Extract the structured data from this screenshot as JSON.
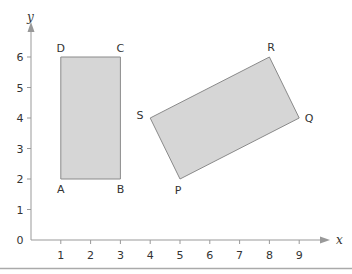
{
  "diagram": {
    "type": "coordinate-grid",
    "x_axis": {
      "label": "x",
      "ticks": [
        1,
        2,
        3,
        4,
        5,
        6,
        7,
        8,
        9
      ],
      "origin_label": "0"
    },
    "y_axis": {
      "label": "y",
      "ticks": [
        1,
        2,
        3,
        4,
        5,
        6
      ]
    },
    "shapes": [
      {
        "name": "rectangle-ABCD",
        "fill": "#d6d6d6",
        "stroke": "#8a8a8a",
        "vertices": [
          {
            "label": "A",
            "x": 1,
            "y": 2
          },
          {
            "label": "B",
            "x": 3,
            "y": 2
          },
          {
            "label": "C",
            "x": 3,
            "y": 6
          },
          {
            "label": "D",
            "x": 1,
            "y": 6
          }
        ]
      },
      {
        "name": "rectangle-PQRS",
        "fill": "#d6d6d6",
        "stroke": "#8a8a8a",
        "vertices": [
          {
            "label": "P",
            "x": 5,
            "y": 2
          },
          {
            "label": "Q",
            "x": 9,
            "y": 4
          },
          {
            "label": "R",
            "x": 8,
            "y": 6
          },
          {
            "label": "S",
            "x": 4,
            "y": 4
          }
        ]
      }
    ],
    "labels": {
      "x": "x",
      "y": "y",
      "zero": "0",
      "xt1": "1",
      "xt2": "2",
      "xt3": "3",
      "xt4": "4",
      "xt5": "5",
      "xt6": "6",
      "xt7": "7",
      "xt8": "8",
      "xt9": "9",
      "yt1": "1",
      "yt2": "2",
      "yt3": "3",
      "yt4": "4",
      "yt5": "5",
      "yt6": "6",
      "A": "A",
      "B": "B",
      "C": "C",
      "D": "D",
      "P": "P",
      "Q": "Q",
      "R": "R",
      "S": "S"
    }
  }
}
